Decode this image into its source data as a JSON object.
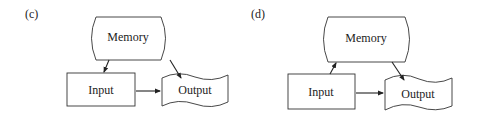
{
  "panels": [
    {
      "label": "(c)",
      "nodes": {
        "memory": {
          "label": "Memory",
          "shape": "storage"
        },
        "input": {
          "label": "Input",
          "shape": "rectangle"
        },
        "output": {
          "label": "Output",
          "shape": "document"
        }
      },
      "edges": [
        {
          "from": "Memory",
          "to": "Input"
        },
        {
          "from": "Memory",
          "to": "Output"
        },
        {
          "from": "Input",
          "to": "Output"
        }
      ]
    },
    {
      "label": "(d)",
      "nodes": {
        "memory": {
          "label": "Memory",
          "shape": "storage"
        },
        "input": {
          "label": "Input",
          "shape": "rectangle"
        },
        "output": {
          "label": "Output",
          "shape": "document"
        }
      },
      "edges": [
        {
          "from": "Input",
          "to": "Memory"
        },
        {
          "from": "Memory",
          "to": "Output"
        },
        {
          "from": "Input",
          "to": "Output"
        }
      ]
    }
  ],
  "colors": {
    "stroke": "#333333",
    "background": "#ffffff"
  }
}
